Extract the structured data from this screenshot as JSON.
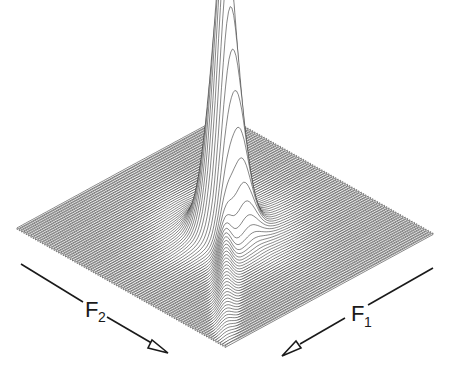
{
  "chart_data": {
    "type": "surface",
    "title": "",
    "axes": {
      "f2": {
        "label": "F",
        "subscript": "2",
        "direction": "toward front-right"
      },
      "f1": {
        "label": "F",
        "subscript": "1",
        "direction": "toward front-left"
      }
    },
    "grid": false,
    "legend": null,
    "surface": {
      "n_traces": 90,
      "n_points": 120,
      "peak_center": [
        0.5,
        0.5
      ],
      "peak_height": 1.0,
      "peak_width": 0.05,
      "ridge_amplitude": 0.12,
      "ridge_width": 0.03
    },
    "geometry": {
      "corner_back": [
        225,
        115
      ],
      "corner_left": [
        17,
        228
      ],
      "corner_right": [
        433,
        233
      ],
      "corner_front": [
        223,
        355
      ],
      "z_scale": 290
    },
    "annotations": [
      {
        "text": "F2",
        "position": "lower-left",
        "arrow": "points down-right"
      },
      {
        "text": "F1",
        "position": "lower-right",
        "arrow": "points down-left"
      }
    ]
  },
  "labels": {
    "f2_main": "F",
    "f2_sub": "2",
    "f1_main": "F",
    "f1_sub": "1"
  }
}
